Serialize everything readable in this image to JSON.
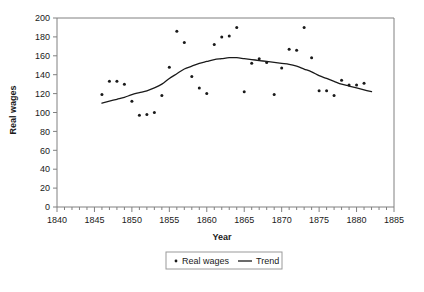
{
  "chart_data": {
    "type": "scatter",
    "title": "",
    "xlabel": "Year",
    "ylabel": "Real wages",
    "xlim": [
      1840,
      1885
    ],
    "ylim": [
      0,
      200
    ],
    "ytick_step": 20,
    "xtick_major_step": 5,
    "xtick_minor_step": 1,
    "grid": false,
    "legend_position": "bottom-center",
    "x_ticklabels": [
      "1840",
      "1845",
      "1850",
      "1855",
      "1860",
      "1865",
      "1870",
      "1875",
      "1880",
      "1885"
    ],
    "y_ticklabels": [
      "0",
      "20",
      "40",
      "60",
      "80",
      "100",
      "120",
      "140",
      "160",
      "180",
      "200"
    ],
    "series": [
      {
        "name": "Real wages",
        "type": "scatter",
        "marker": "dot",
        "color": "#1a1a1a",
        "points": [
          {
            "x": 1846,
            "y": 119
          },
          {
            "x": 1847,
            "y": 133
          },
          {
            "x": 1848,
            "y": 133
          },
          {
            "x": 1849,
            "y": 130
          },
          {
            "x": 1850,
            "y": 112
          },
          {
            "x": 1851,
            "y": 97
          },
          {
            "x": 1852,
            "y": 98
          },
          {
            "x": 1853,
            "y": 100
          },
          {
            "x": 1854,
            "y": 118
          },
          {
            "x": 1855,
            "y": 148
          },
          {
            "x": 1856,
            "y": 186
          },
          {
            "x": 1857,
            "y": 174
          },
          {
            "x": 1858,
            "y": 138
          },
          {
            "x": 1859,
            "y": 126
          },
          {
            "x": 1860,
            "y": 120
          },
          {
            "x": 1861,
            "y": 172
          },
          {
            "x": 1862,
            "y": 180
          },
          {
            "x": 1863,
            "y": 181
          },
          {
            "x": 1864,
            "y": 190
          },
          {
            "x": 1865,
            "y": 122
          },
          {
            "x": 1866,
            "y": 152
          },
          {
            "x": 1867,
            "y": 157
          },
          {
            "x": 1868,
            "y": 153
          },
          {
            "x": 1869,
            "y": 119
          },
          {
            "x": 1870,
            "y": 147
          },
          {
            "x": 1871,
            "y": 167
          },
          {
            "x": 1872,
            "y": 166
          },
          {
            "x": 1873,
            "y": 190
          },
          {
            "x": 1874,
            "y": 158
          },
          {
            "x": 1875,
            "y": 123
          },
          {
            "x": 1876,
            "y": 123
          },
          {
            "x": 1877,
            "y": 118
          },
          {
            "x": 1878,
            "y": 134
          },
          {
            "x": 1879,
            "y": 129
          },
          {
            "x": 1880,
            "y": 129
          },
          {
            "x": 1881,
            "y": 131
          }
        ]
      },
      {
        "name": "Trend",
        "type": "line",
        "color": "#1a1a1a",
        "points": [
          {
            "x": 1846.0,
            "y": 110
          },
          {
            "x": 1847.0,
            "y": 112
          },
          {
            "x": 1848.0,
            "y": 114
          },
          {
            "x": 1849.0,
            "y": 116
          },
          {
            "x": 1850.0,
            "y": 119
          },
          {
            "x": 1851.0,
            "y": 121
          },
          {
            "x": 1852.0,
            "y": 123
          },
          {
            "x": 1853.0,
            "y": 126
          },
          {
            "x": 1854.0,
            "y": 130
          },
          {
            "x": 1855.0,
            "y": 136
          },
          {
            "x": 1856.0,
            "y": 141
          },
          {
            "x": 1857.0,
            "y": 146
          },
          {
            "x": 1858.0,
            "y": 149
          },
          {
            "x": 1859.0,
            "y": 152
          },
          {
            "x": 1860.0,
            "y": 154
          },
          {
            "x": 1861.0,
            "y": 156
          },
          {
            "x": 1862.0,
            "y": 157
          },
          {
            "x": 1863.0,
            "y": 158
          },
          {
            "x": 1864.0,
            "y": 158
          },
          {
            "x": 1865.0,
            "y": 157
          },
          {
            "x": 1866.0,
            "y": 156
          },
          {
            "x": 1867.0,
            "y": 155
          },
          {
            "x": 1868.0,
            "y": 154
          },
          {
            "x": 1869.0,
            "y": 153
          },
          {
            "x": 1870.0,
            "y": 152
          },
          {
            "x": 1871.0,
            "y": 151
          },
          {
            "x": 1872.0,
            "y": 149
          },
          {
            "x": 1873.0,
            "y": 146
          },
          {
            "x": 1874.0,
            "y": 143
          },
          {
            "x": 1875.0,
            "y": 139
          },
          {
            "x": 1876.0,
            "y": 136
          },
          {
            "x": 1877.0,
            "y": 133
          },
          {
            "x": 1878.0,
            "y": 130
          },
          {
            "x": 1879.0,
            "y": 128
          },
          {
            "x": 1880.0,
            "y": 126
          },
          {
            "x": 1881.0,
            "y": 124
          },
          {
            "x": 1882.0,
            "y": 122
          }
        ]
      }
    ]
  },
  "legend": {
    "items": [
      {
        "label": "Real wages",
        "marker": "dot"
      },
      {
        "label": "Trend",
        "marker": "line"
      }
    ]
  },
  "caption": {
    "text": ""
  }
}
